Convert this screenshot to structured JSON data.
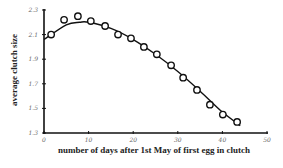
{
  "chart_data": {
    "type": "scatter",
    "title": "",
    "xlabel": "number of days after 1st May of first egg in clutch",
    "ylabel": "average clutch size",
    "xlim": [
      0,
      50
    ],
    "ylim": [
      1.3,
      2.3
    ],
    "xticks": [
      0,
      10,
      20,
      30,
      40,
      50
    ],
    "yticks": [
      1.3,
      1.5,
      1.7,
      1.9,
      2.1,
      2.3
    ],
    "ytick_labels": [
      "1.3",
      "1.5",
      "1.7",
      "1.9",
      "2.1",
      "2.3"
    ],
    "xtick_labels": [
      "0",
      "10",
      "20",
      "30",
      "40",
      "50"
    ],
    "grid": false,
    "legend": null,
    "series": [
      {
        "name": "observed",
        "marker": "open-circle",
        "x": [
          1.6,
          4.5,
          7.6,
          10.5,
          13.7,
          16.6,
          19.5,
          22.4,
          25.3,
          28.5,
          31.2,
          34.3,
          37.2,
          40.1,
          43.3
        ],
        "y": [
          2.1,
          2.22,
          2.25,
          2.21,
          2.17,
          2.1,
          2.07,
          2.0,
          1.94,
          1.85,
          1.75,
          1.65,
          1.53,
          1.45,
          1.39
        ]
      },
      {
        "name": "fitted curve",
        "type": "line",
        "x": [
          0,
          5,
          8,
          10,
          15,
          20,
          25,
          30,
          35,
          40,
          44
        ],
        "y": [
          2.06,
          2.18,
          2.2,
          2.2,
          2.15,
          2.06,
          1.94,
          1.8,
          1.64,
          1.47,
          1.36
        ]
      }
    ]
  }
}
